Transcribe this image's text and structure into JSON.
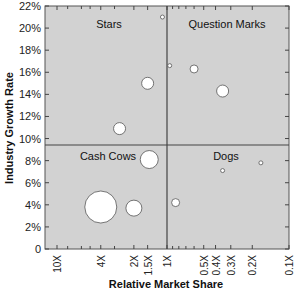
{
  "chart_data": {
    "type": "scatter",
    "subtype": "bubble",
    "title": "",
    "xlabel": "Relative Market Share",
    "ylabel": "Industry Growth Rate",
    "x_scale": "log-reversed",
    "x_ticks": [
      "10X",
      "4X",
      "2X",
      "1.5X",
      "1X",
      "0.5X",
      "0.4X",
      "0.3X",
      "0.2X",
      "0.1X"
    ],
    "x_tick_values": [
      10,
      4,
      2,
      1.5,
      1,
      0.5,
      0.4,
      0.3,
      0.2,
      0.1
    ],
    "y_ticks": [
      "0",
      "2%",
      "4%",
      "6%",
      "8%",
      "10%",
      "12%",
      "14%",
      "16%",
      "18%",
      "20%",
      "22%"
    ],
    "ylim": [
      0,
      22
    ],
    "xlim": [
      10,
      0.1
    ],
    "grid": false,
    "dividers": {
      "x": 1,
      "y": 10
    },
    "quadrants": [
      {
        "label": "Stars",
        "position": "top-left"
      },
      {
        "label": "Question Marks",
        "position": "top-right"
      },
      {
        "label": "Cash Cows",
        "position": "bottom-left"
      },
      {
        "label": "Dogs",
        "position": "bottom-right"
      }
    ],
    "points": [
      {
        "x": 1.1,
        "y": 21.0,
        "size": 2
      },
      {
        "x": 1.5,
        "y": 15.0,
        "size": 6
      },
      {
        "x": 2.7,
        "y": 10.9,
        "size": 6
      },
      {
        "x": 0.95,
        "y": 16.6,
        "size": 2
      },
      {
        "x": 0.6,
        "y": 16.3,
        "size": 4
      },
      {
        "x": 0.35,
        "y": 14.3,
        "size": 6
      },
      {
        "x": 1.45,
        "y": 8.1,
        "size": 9
      },
      {
        "x": 4.0,
        "y": 3.8,
        "size": 16
      },
      {
        "x": 2.0,
        "y": 3.7,
        "size": 8
      },
      {
        "x": 0.85,
        "y": 4.2,
        "size": 4
      },
      {
        "x": 0.35,
        "y": 7.1,
        "size": 2
      },
      {
        "x": 0.17,
        "y": 7.8,
        "size": 2
      }
    ]
  },
  "colors": {
    "plot_bg": "#d2d2d2",
    "bubble_fill": "#ffffff",
    "axis": "#444444"
  }
}
